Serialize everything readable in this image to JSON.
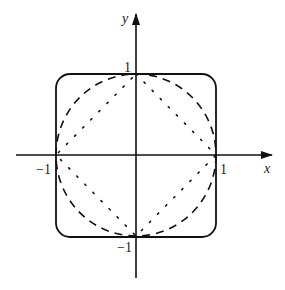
{
  "diagram": {
    "type": "unit-balls",
    "axes": {
      "x_label": "x",
      "y_label": "y",
      "origin": [
        136,
        155
      ],
      "unit_px": 80,
      "x_range_px": [
        16,
        272
      ],
      "y_range_px": [
        15,
        278
      ]
    },
    "ticks": {
      "x_pos": "1",
      "x_neg": "−1",
      "y_pos": "1",
      "y_neg": "−1"
    },
    "curves": [
      {
        "name": "high-p norm (rounded square)",
        "style": "solid"
      },
      {
        "name": "L2 norm (circle)",
        "style": "dashed"
      },
      {
        "name": "L1 norm (diamond)",
        "style": "dotted"
      }
    ],
    "colors": {
      "stroke": "#111111",
      "background": "#ffffff"
    }
  }
}
